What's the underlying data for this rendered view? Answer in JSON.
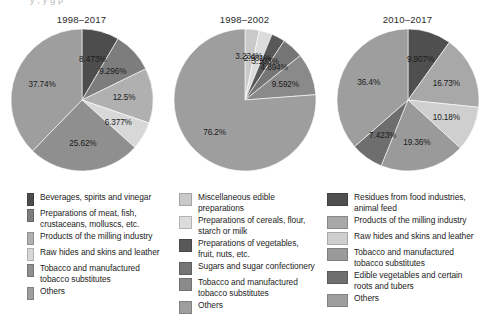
{
  "cut_text": "y  ,  y   g     p     ",
  "chart_data": [
    {
      "type": "pie",
      "title": "1998–2017",
      "labels": [
        "Beverages, spirits and vinegar",
        "Preparations of meat, fish, crustaceans, molluscs, etc.",
        "Products of the milling industry",
        "Raw hides and skins and leather",
        "Tobacco and manufactured tobacco substitutes",
        "Others"
      ],
      "values": [
        8.473,
        9.296,
        12.5,
        6.377,
        25.62,
        37.74
      ],
      "value_labels": [
        "8.473%",
        "9.296%",
        "12.5%",
        "6.377%",
        "25.62%",
        "37.74%"
      ],
      "colors": [
        "#4d4d4d",
        "#7d7d7d",
        "#b0b0b0",
        "#d8d8d8",
        "#8f8f8f",
        "#9e9e9e"
      ]
    },
    {
      "type": "pie",
      "title": "1998–2002",
      "labels": [
        "Miscellaneous edible preparations",
        "Preparations of cereals, flour, starch or milk",
        "Preparations of vegetables, fruit, nuts, etc.",
        "Sugars and sugar confectionery",
        "Tobacco and manufactured tobacco substitutes",
        "Others"
      ],
      "values": [
        3.234,
        2.981,
        3.103,
        4.894,
        9.592,
        76.2
      ],
      "value_labels": [
        "3.234%",
        "2.981%",
        "3.103%",
        "4.894%",
        "9.592%",
        "76.2%"
      ],
      "colors": [
        "#c9c9c9",
        "#dcdcdc",
        "#585858",
        "#757575",
        "#8a8a8a",
        "#9e9e9e"
      ]
    },
    {
      "type": "pie",
      "title": "2010–2017",
      "labels": [
        "Residues from food industries, animal feed",
        "Products of the milling industry",
        "Raw hides and skins and leather",
        "Tobacco and manufactured tobacco substitutes",
        "Edible vegetables and certain roots and tubers",
        "Others"
      ],
      "values": [
        9.907,
        16.73,
        10.18,
        19.36,
        7.423,
        36.4
      ],
      "value_labels": [
        "9.907%",
        "16.73%",
        "10.18%",
        "19.36%",
        "7.423%",
        "36.4%"
      ],
      "colors": [
        "#4f4f4f",
        "#a8a8a8",
        "#cfcfcf",
        "#9a9a9a",
        "#6e6e6e",
        "#9e9e9e"
      ]
    }
  ],
  "legend": {
    "columns": [
      {
        "items": [
          {
            "color": "#4d4d4d",
            "line1": "Beverages, spirits and vinegar",
            "line2": ""
          },
          {
            "color": "#7d7d7d",
            "line1": "Preparations of meat, fish,",
            "line2": "crustaceans, molluscs, etc."
          },
          {
            "color": "#b0b0b0",
            "line1": "Products of the milling industry",
            "line2": ""
          },
          {
            "color": "#d8d8d8",
            "line1": "Raw hides and skins and leather",
            "line2": ""
          },
          {
            "color": "#8f8f8f",
            "line1": "Tobacco and manufactured",
            "line2": "tobacco substitutes"
          },
          {
            "color": "#9e9e9e",
            "line1": "Others",
            "line2": ""
          }
        ]
      },
      {
        "items": [
          {
            "color": "#c9c9c9",
            "line1": "Miscellaneous edible preparations",
            "line2": ""
          },
          {
            "color": "#dcdcdc",
            "line1": "Preparations of cereals, flour,",
            "line2": "starch or milk"
          },
          {
            "color": "#585858",
            "line1": "Preparations of vegetables,",
            "line2": "fruit, nuts, etc."
          },
          {
            "color": "#757575",
            "line1": "Sugars and sugar confectionery",
            "line2": ""
          },
          {
            "color": "#8a8a8a",
            "line1": "Tobacco and manufactured",
            "line2": "tobacco substitutes"
          },
          {
            "color": "#9e9e9e",
            "line1": "Others",
            "line2": ""
          }
        ]
      },
      {
        "items": [
          {
            "color": "#4f4f4f",
            "line1": "Residues from food industries,",
            "line2": "animal feed"
          },
          {
            "color": "#a8a8a8",
            "line1": "Products of the milling industry",
            "line2": ""
          },
          {
            "color": "#cfcfcf",
            "line1": "Raw hides and skins and leather",
            "line2": ""
          },
          {
            "color": "#9a9a9a",
            "line1": "Tobacco and manufactured",
            "line2": "tobacco substitutes"
          },
          {
            "color": "#6e6e6e",
            "line1": "Edible vegetables and certain",
            "line2": "roots and tubers"
          },
          {
            "color": "#9e9e9e",
            "line1": "Others",
            "line2": ""
          }
        ]
      }
    ]
  }
}
